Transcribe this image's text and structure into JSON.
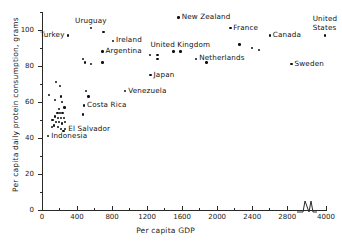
{
  "chart_data": {
    "type": "scatter",
    "title": "",
    "xlabel": "Per capita GDP",
    "ylabel": "Per capita daily protein consumption, grams",
    "xlim": [
      0,
      4000
    ],
    "ylim": [
      0,
      110
    ],
    "grid": false,
    "legend": null,
    "axis_break": {
      "axis": "x",
      "from": 2900,
      "to": 3900,
      "note": "zigzag break between 2800 and 4000"
    },
    "x_ticks": [
      0,
      400,
      800,
      1200,
      1600,
      2000,
      2400,
      2800,
      4000
    ],
    "x_tick_labels": [
      "0",
      "400",
      "800",
      "1200",
      "1600",
      "2000",
      "2400",
      "2800",
      "4000"
    ],
    "x_minor_ticks": [
      200,
      600,
      1000,
      1400,
      1800,
      2200,
      2600
    ],
    "y_ticks": [
      0,
      20,
      40,
      60,
      80,
      100
    ],
    "y_tick_labels": [
      "0",
      "20",
      "40",
      "60",
      "80",
      "100"
    ],
    "y_minor_ticks": [
      10,
      30,
      50,
      70,
      90,
      110
    ],
    "points": [
      {
        "label": "New Zealand",
        "x": 1560,
        "y": 107,
        "label_pos": "right"
      },
      {
        "label": "France",
        "x": 2150,
        "y": 101,
        "label_pos": "right"
      },
      {
        "label": "United States",
        "x": 3990,
        "y": 97,
        "label_pos": "above"
      },
      {
        "label": "Canada",
        "x": 2600,
        "y": 97,
        "label_pos": "right"
      },
      {
        "label": "Uruguay",
        "x": 560,
        "y": 101,
        "label_pos": "above"
      },
      {
        "label": "Ireland",
        "x": 810,
        "y": 94,
        "label_pos": "right"
      },
      {
        "label": "Turkey",
        "x": 300,
        "y": 97,
        "label_pos": "left"
      },
      {
        "label": "Argentina",
        "x": 690,
        "y": 88,
        "label_pos": "right"
      },
      {
        "label": "United Kingdom",
        "x": 1580,
        "y": 88,
        "label_pos": "above"
      },
      {
        "label": "Netherlands",
        "x": 1760,
        "y": 84,
        "label_pos": "right"
      },
      {
        "label": "Sweden",
        "x": 2850,
        "y": 81,
        "label_pos": "right"
      },
      {
        "label": "Japan",
        "x": 1240,
        "y": 75,
        "label_pos": "right"
      },
      {
        "label": "Venezuela",
        "x": 950,
        "y": 66,
        "label_pos": "right"
      },
      {
        "label": "Costa Rica",
        "x": 480,
        "y": 58,
        "label_pos": "right"
      },
      {
        "label": "El Salvador",
        "x": 265,
        "y": 45,
        "label_pos": "right"
      },
      {
        "label": "Indonesia",
        "x": 70,
        "y": 41,
        "label_pos": "right"
      },
      {
        "label": "",
        "x": 700,
        "y": 99
      },
      {
        "label": "",
        "x": 465,
        "y": 84
      },
      {
        "label": "",
        "x": 490,
        "y": 82
      },
      {
        "label": "",
        "x": 560,
        "y": 81
      },
      {
        "label": "",
        "x": 690,
        "y": 82
      },
      {
        "label": "",
        "x": 1230,
        "y": 86
      },
      {
        "label": "",
        "x": 1320,
        "y": 86
      },
      {
        "label": "",
        "x": 1320,
        "y": 84
      },
      {
        "label": "",
        "x": 1500,
        "y": 88
      },
      {
        "label": "",
        "x": 1880,
        "y": 82
      },
      {
        "label": "",
        "x": 2255,
        "y": 92
      },
      {
        "label": "",
        "x": 2400,
        "y": 90
      },
      {
        "label": "",
        "x": 2480,
        "y": 89
      },
      {
        "label": "",
        "x": 160,
        "y": 71
      },
      {
        "label": "",
        "x": 205,
        "y": 69
      },
      {
        "label": "",
        "x": 80,
        "y": 64
      },
      {
        "label": "",
        "x": 215,
        "y": 63
      },
      {
        "label": "",
        "x": 500,
        "y": 66
      },
      {
        "label": "",
        "x": 530,
        "y": 63
      },
      {
        "label": "",
        "x": 150,
        "y": 61
      },
      {
        "label": "",
        "x": 230,
        "y": 60
      },
      {
        "label": "",
        "x": 255,
        "y": 57
      },
      {
        "label": "",
        "x": 195,
        "y": 56
      },
      {
        "label": "",
        "x": 465,
        "y": 53
      },
      {
        "label": "",
        "x": 175,
        "y": 54
      },
      {
        "label": "",
        "x": 205,
        "y": 54
      },
      {
        "label": "",
        "x": 235,
        "y": 54
      },
      {
        "label": "",
        "x": 150,
        "y": 52
      },
      {
        "label": "",
        "x": 185,
        "y": 51
      },
      {
        "label": "",
        "x": 215,
        "y": 51
      },
      {
        "label": "",
        "x": 250,
        "y": 51
      },
      {
        "label": "",
        "x": 120,
        "y": 50
      },
      {
        "label": "",
        "x": 160,
        "y": 49
      },
      {
        "label": "",
        "x": 195,
        "y": 49
      },
      {
        "label": "",
        "x": 225,
        "y": 48
      },
      {
        "label": "",
        "x": 265,
        "y": 49
      },
      {
        "label": "",
        "x": 140,
        "y": 47
      },
      {
        "label": "",
        "x": 180,
        "y": 46
      },
      {
        "label": "",
        "x": 215,
        "y": 45
      },
      {
        "label": "",
        "x": 115,
        "y": 46
      },
      {
        "label": "",
        "x": 245,
        "y": 44
      }
    ]
  }
}
